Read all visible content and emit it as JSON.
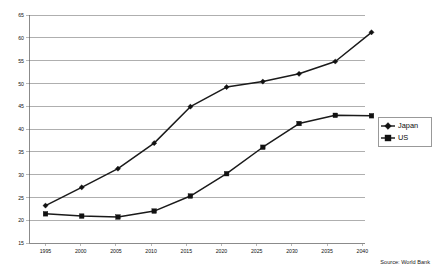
{
  "chart_data": {
    "type": "line",
    "title": "",
    "subtitle": "",
    "xlabel": "",
    "ylabel": "",
    "categories": [
      "1995",
      "2000",
      "2005",
      "2010",
      "2015",
      "2020",
      "2025",
      "2030",
      "2035",
      "2040"
    ],
    "x": [
      1995,
      2000,
      2005,
      2010,
      2015,
      2020,
      2025,
      2030,
      2035,
      2040
    ],
    "series": [
      {
        "name": "Japan",
        "marker": "diamond",
        "color": "#111111",
        "values": [
          23.2,
          27.2,
          31.3,
          36.9,
          44.9,
          49.2,
          50.4,
          52.1,
          54.8,
          61.2
        ]
      },
      {
        "name": "US",
        "marker": "square",
        "color": "#111111",
        "values": [
          21.4,
          20.9,
          20.7,
          22.0,
          25.3,
          30.2,
          36.0,
          41.2,
          43.0,
          42.9
        ]
      }
    ],
    "ylim": [
      15,
      65
    ],
    "ytick_step": 5,
    "ytick_labels": [
      "15",
      "20",
      "25",
      "30",
      "35",
      "40",
      "45",
      "50",
      "55",
      "60",
      "65"
    ],
    "ytick_values": [
      15,
      20,
      25,
      30,
      35,
      40,
      45,
      50,
      55,
      60,
      65
    ],
    "xlim": [
      1995,
      2040
    ],
    "grid": "horizontal",
    "legend_position": "right",
    "legend_entries": [
      "Japan",
      "US"
    ],
    "annotations": {
      "source": "Source: World Bank"
    }
  }
}
